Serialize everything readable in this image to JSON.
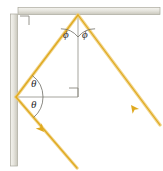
{
  "figure": {
    "type": "optics-ray-diagram",
    "width": 163,
    "height": 171,
    "background": "#ffffff"
  },
  "colors": {
    "ray": "#e8b838",
    "ray_light": "#f3d98a",
    "ray_core": "#d9a62a",
    "mirror_face": "#e8e7e0",
    "mirror_edge": "#b5b3a8",
    "mirror_shade": "#cfcdc2",
    "normal_line": "#9b9a92",
    "arc_line": "#6e6d66",
    "label_text": "#2b2b2b",
    "right_angle": "#8a8880"
  },
  "mirrors": [
    {
      "name": "top-mirror",
      "orientation": "horizontal",
      "x1": 18,
      "y1": 11,
      "x2": 160,
      "y2": 11,
      "thickness": 7
    },
    {
      "name": "left-mirror",
      "orientation": "vertical",
      "x1": 14,
      "y1": 14,
      "x2": 14,
      "y2": 166,
      "thickness": 7
    }
  ],
  "rays": [
    {
      "name": "incoming-ray",
      "from": [
        77,
        168
      ],
      "to": [
        16,
        97
      ],
      "direction": "up-left",
      "arrow_at": [
        50,
        138
      ],
      "arrow_angle": 229
    },
    {
      "name": "reflected-ray-upward",
      "from": [
        16,
        97
      ],
      "to": [
        78,
        15
      ],
      "direction": "up-right",
      "arrow_at": null
    },
    {
      "name": "outgoing-ray",
      "from": [
        78,
        15
      ],
      "to": [
        160,
        125
      ],
      "direction": "down-right",
      "arrow_at": [
        131,
        105
      ],
      "arrow_angle": 53
    }
  ],
  "normals": [
    {
      "name": "vertical-normal",
      "x1": 78,
      "y1": 15,
      "x2": 78,
      "y2": 97,
      "note": "normal to top mirror"
    },
    {
      "name": "horizontal-normal",
      "x1": 16,
      "y1": 97,
      "x2": 78,
      "y2": 97,
      "note": "normal to left mirror"
    }
  ],
  "right_angles": [
    {
      "name": "corner-right-angle",
      "x": 20,
      "y": 16,
      "size": 9
    },
    {
      "name": "normals-right-angle",
      "x": 69,
      "y": 88,
      "size": 9
    }
  ],
  "angle_arcs": [
    {
      "name": "phi-left-arc",
      "cx": 78,
      "cy": 15,
      "r": 22,
      "a1": 101,
      "a2": 90
    },
    {
      "name": "phi-right-arc",
      "cx": 78,
      "cy": 15,
      "r": 22,
      "a1": 90,
      "a2": 53
    },
    {
      "name": "theta-upper-arc",
      "cx": 16,
      "cy": 97,
      "r": 27,
      "a1": 307,
      "a2": 0
    },
    {
      "name": "theta-lower-arc",
      "cx": 16,
      "cy": 97,
      "r": 27,
      "a1": 0,
      "a2": 49
    }
  ],
  "labels": [
    {
      "name": "phi-left-label",
      "text": "ϕ",
      "x": 66,
      "y": 35
    },
    {
      "name": "phi-right-label",
      "text": "ϕ",
      "x": 84,
      "y": 35
    },
    {
      "name": "theta-upper-label",
      "text": "θ",
      "x": 33,
      "y": 83
    },
    {
      "name": "theta-lower-label",
      "text": "θ",
      "x": 33,
      "y": 103
    }
  ]
}
